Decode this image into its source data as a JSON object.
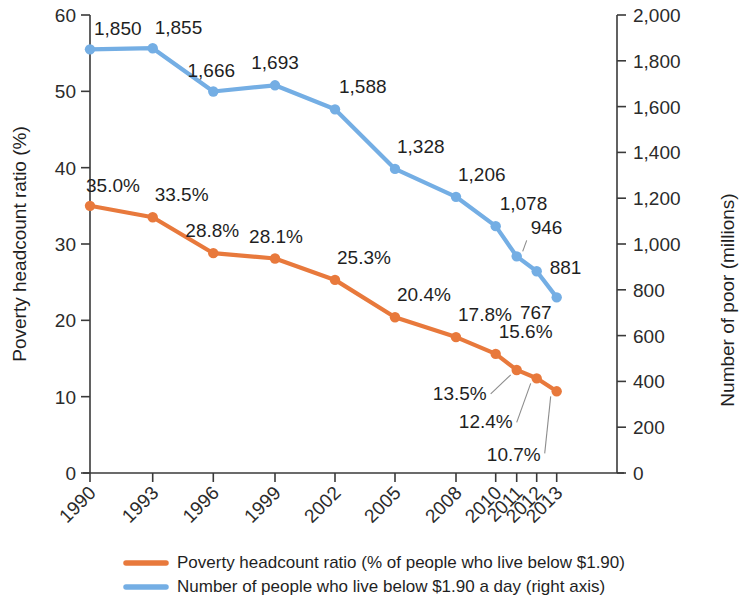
{
  "chart_data": {
    "type": "line",
    "title": "",
    "subtitle": "",
    "xlabel": "",
    "ylabel": "Poverty headcount ratio (%)",
    "y2label": "Number of poor (millions)",
    "categories": [
      "1990",
      "1993",
      "1996",
      "1999",
      "2002",
      "2005",
      "2008",
      "2010",
      "2011",
      "2012",
      "2013"
    ],
    "ylim": [
      0,
      60
    ],
    "yticks": [
      "0",
      "10",
      "20",
      "30",
      "40",
      "50",
      "60"
    ],
    "y2lim": [
      0,
      2000
    ],
    "y2ticks": [
      "0",
      "200",
      "400",
      "600",
      "800",
      "1,000",
      "1,200",
      "1,400",
      "1,600",
      "1,800",
      "2,000"
    ],
    "grid": false,
    "legend_position": "bottom",
    "series": [
      {
        "name": "Poverty headcount ratio (% of people who live below $1.90)",
        "axis": "left",
        "color": "#e8793c",
        "values": [
          35.0,
          33.5,
          28.8,
          28.1,
          25.3,
          20.4,
          17.8,
          15.6,
          13.5,
          12.4,
          10.7
        ],
        "labels": [
          "35.0%",
          "33.5%",
          "28.8%",
          "28.1%",
          "25.3%",
          "20.4%",
          "17.8%",
          "15.6%",
          "13.5%",
          "12.4%",
          "10.7%"
        ]
      },
      {
        "name": "Number of people who live below $1.90 a day (right axis)",
        "axis": "right",
        "color": "#74aee4",
        "values": [
          1850,
          1855,
          1666,
          1693,
          1588,
          1328,
          1206,
          1078,
          946,
          881,
          767
        ],
        "labels": [
          "1,850",
          "1,855",
          "1,666",
          "1,693",
          "1,588",
          "1,328",
          "1,206",
          "1,078",
          "946",
          "881",
          "767"
        ]
      }
    ]
  },
  "legend": {
    "items": [
      {
        "label": "Poverty headcount ratio (% of people who live below $1.90)",
        "color": "#e8793c"
      },
      {
        "label": "Number of people who live below $1.90 a day (right axis)",
        "color": "#74aee4"
      }
    ]
  },
  "axes": {
    "left_title": "Poverty headcount ratio (%)",
    "right_title": "Number of poor (millions)"
  }
}
